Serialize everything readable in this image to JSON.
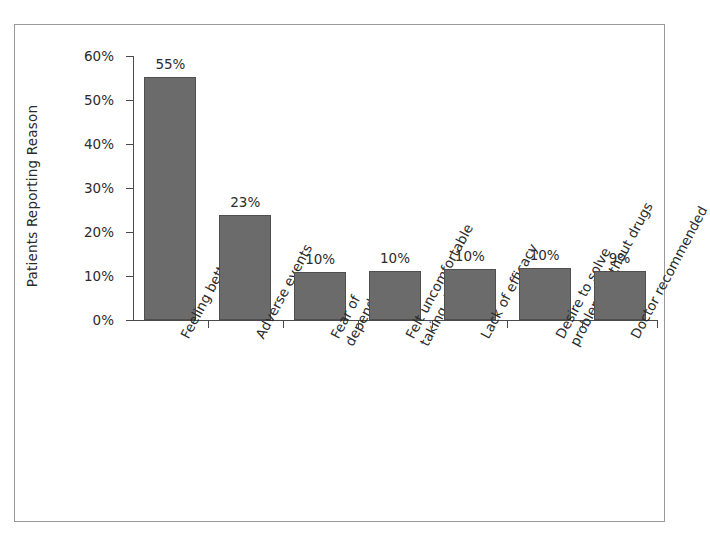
{
  "chart_data": {
    "type": "bar",
    "title": "",
    "subtitle": "",
    "xlabel": "",
    "ylabel": "Patients Reporting Reason",
    "ylim": [
      0,
      60
    ],
    "yticks": [
      0,
      10,
      20,
      30,
      40,
      50,
      60
    ],
    "ytick_labels": [
      "0%",
      "10%",
      "20%",
      "30%",
      "40%",
      "50%",
      "60%"
    ],
    "grid": false,
    "legend": "none",
    "orientation": "vertical",
    "bar_color": "#6b6b6b",
    "bar_edge_color": "#4f4f4f",
    "axis_color": "#4a4a4a",
    "frame_color": "#9a9a9a",
    "background": "#ffffff",
    "categories": [
      "Feeling better",
      "Adverse events",
      "Fear of dependence",
      "Felt uncomfortable taking drugs",
      "Lack of efficacy",
      "Desire to solve problems without drugs",
      "Doctor recommended"
    ],
    "category_lines": [
      [
        "Feeling better"
      ],
      [
        "Adverse events"
      ],
      [
        "Fear of",
        "dependence"
      ],
      [
        "Felt uncomfortable",
        "taking drugs"
      ],
      [
        "Lack of efficacy"
      ],
      [
        "Desire to solve",
        "problems without drugs"
      ],
      [
        "Doctor recommended"
      ]
    ],
    "values": [
      55,
      23,
      10,
      10,
      10,
      10,
      9
    ],
    "plotted_values": [
      55.3,
      23.8,
      10.9,
      11.2,
      11.5,
      11.9,
      11.2
    ],
    "data_labels": [
      "55%",
      "23%",
      "10%",
      "10%",
      "10%",
      "10%",
      "9%"
    ]
  },
  "axes": {
    "y_axis_title": "Patients Reporting Reason"
  }
}
